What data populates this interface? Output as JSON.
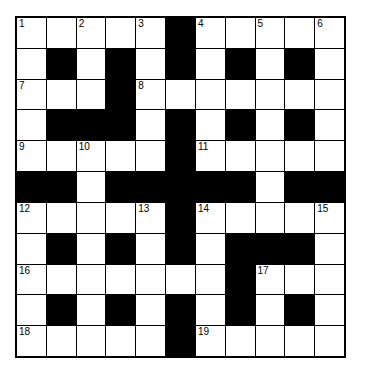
{
  "puzzle": {
    "rows": 11,
    "cols": 11,
    "layout": [
      "WWWWWBWWWWW",
      "WBWBWBWBWBW",
      "WWWBWWWWWWW",
      "WBBBWBWBWBW",
      "WWWWWBWWWWW",
      "BBWBBBBBWBB",
      "WWWWWBWWWWW",
      "WBWBWBWBBBW",
      "WWWWWWWBWWW",
      "WBWBWBWBWBW",
      "WWWWWBWWWWW"
    ],
    "numbers": [
      {
        "row": 0,
        "col": 0,
        "n": "1"
      },
      {
        "row": 0,
        "col": 2,
        "n": "2"
      },
      {
        "row": 0,
        "col": 4,
        "n": "3"
      },
      {
        "row": 0,
        "col": 6,
        "n": "4"
      },
      {
        "row": 0,
        "col": 8,
        "n": "5"
      },
      {
        "row": 0,
        "col": 10,
        "n": "6"
      },
      {
        "row": 2,
        "col": 0,
        "n": "7"
      },
      {
        "row": 2,
        "col": 4,
        "n": "8"
      },
      {
        "row": 4,
        "col": 0,
        "n": "9"
      },
      {
        "row": 4,
        "col": 2,
        "n": "10"
      },
      {
        "row": 4,
        "col": 6,
        "n": "11"
      },
      {
        "row": 6,
        "col": 0,
        "n": "12"
      },
      {
        "row": 6,
        "col": 4,
        "n": "13"
      },
      {
        "row": 6,
        "col": 6,
        "n": "14"
      },
      {
        "row": 6,
        "col": 10,
        "n": "15"
      },
      {
        "row": 8,
        "col": 0,
        "n": "16"
      },
      {
        "row": 8,
        "col": 8,
        "n": "17"
      },
      {
        "row": 10,
        "col": 0,
        "n": "18"
      },
      {
        "row": 10,
        "col": 6,
        "n": "19"
      }
    ]
  }
}
